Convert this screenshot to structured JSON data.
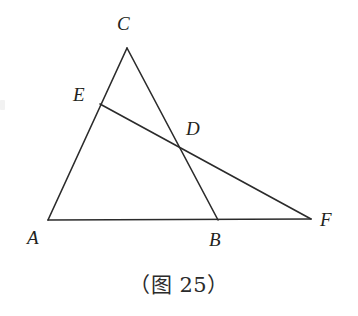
{
  "figure": {
    "caption": "（图 25）",
    "background_color": "#ffffff",
    "stroke_color": "#2b2b2b",
    "stroke_width": 1.6,
    "label_color": "#231f20",
    "points": {
      "A": {
        "label": "A",
        "x": 48,
        "y": 220,
        "label_x": 27,
        "label_y": 228
      },
      "B": {
        "label": "B",
        "x": 218,
        "y": 220,
        "label_x": 209,
        "label_y": 230
      },
      "C": {
        "label": "C",
        "x": 127,
        "y": 48,
        "label_x": 117,
        "label_y": 14
      },
      "D": {
        "label": "D",
        "x": 180,
        "y": 149,
        "label_x": 186,
        "label_y": 119
      },
      "E": {
        "label": "E",
        "x": 100,
        "y": 104,
        "label_x": 73,
        "label_y": 85
      },
      "F": {
        "label": "F",
        "x": 311,
        "y": 219,
        "label_x": 320,
        "label_y": 210
      }
    },
    "segments": [
      {
        "name": "segment-AC",
        "from": "A",
        "to": "C"
      },
      {
        "name": "segment-CB",
        "from": "C",
        "to": "B"
      },
      {
        "name": "segment-AF",
        "from": "A",
        "to": "F"
      },
      {
        "name": "segment-EF",
        "from": "E",
        "to": "F"
      }
    ]
  }
}
